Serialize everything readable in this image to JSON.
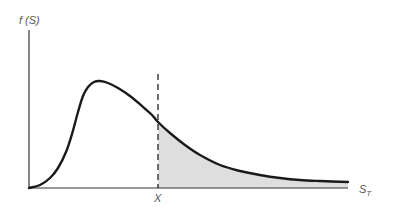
{
  "chart_data": {
    "type": "area",
    "title": "",
    "ylabel": "f (S)",
    "xlabel": "S_T",
    "xlabel_main": "S",
    "xlabel_sub": "T",
    "threshold_label": "X",
    "grid": false,
    "legend": "none",
    "curve_points_px": [
      [
        29,
        188
      ],
      [
        40,
        185
      ],
      [
        50,
        178
      ],
      [
        58,
        168
      ],
      [
        66,
        152
      ],
      [
        72,
        134
      ],
      [
        78,
        112
      ],
      [
        83,
        96
      ],
      [
        88,
        87
      ],
      [
        94,
        82
      ],
      [
        100,
        81
      ],
      [
        108,
        83
      ],
      [
        118,
        88
      ],
      [
        130,
        96
      ],
      [
        142,
        106
      ],
      [
        152,
        115
      ],
      [
        158,
        122
      ],
      [
        170,
        133
      ],
      [
        185,
        145
      ],
      [
        200,
        155
      ],
      [
        220,
        165
      ],
      [
        240,
        171
      ],
      [
        260,
        175
      ],
      [
        280,
        178
      ],
      [
        300,
        180
      ],
      [
        320,
        181
      ],
      [
        348,
        182
      ]
    ],
    "threshold_x_px": 158,
    "axes_px": {
      "origin": [
        29,
        188
      ],
      "y_top": 30,
      "x_right": 348
    },
    "colors": {
      "curve": "#1a1a1a",
      "axis": "#333333",
      "shade": "#dedede",
      "dashed_line": "#222222",
      "label": "#555555"
    }
  }
}
